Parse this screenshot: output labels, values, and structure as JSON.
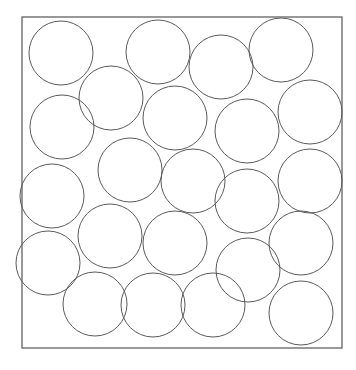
{
  "diagram": {
    "type": "circle-packing-in-square",
    "container": {
      "shape": "square",
      "x": 22,
      "y": 17,
      "width": 320,
      "height": 331,
      "stroke": "#555555"
    },
    "circle_count": 23,
    "circle_radius": 32,
    "circle_stroke": "#5a5a5a",
    "circles": [
      {
        "cx": 61,
        "cy": 53
      },
      {
        "cx": 158,
        "cy": 52
      },
      {
        "cx": 221,
        "cy": 67
      },
      {
        "cx": 281,
        "cy": 50
      },
      {
        "cx": 111,
        "cy": 98
      },
      {
        "cx": 62,
        "cy": 127
      },
      {
        "cx": 175,
        "cy": 118
      },
      {
        "cx": 247,
        "cy": 131
      },
      {
        "cx": 310,
        "cy": 112
      },
      {
        "cx": 130,
        "cy": 170
      },
      {
        "cx": 193,
        "cy": 181
      },
      {
        "cx": 52,
        "cy": 196
      },
      {
        "cx": 247,
        "cy": 201
      },
      {
        "cx": 310,
        "cy": 181
      },
      {
        "cx": 110,
        "cy": 236
      },
      {
        "cx": 175,
        "cy": 243
      },
      {
        "cx": 48,
        "cy": 263
      },
      {
        "cx": 301,
        "cy": 243
      },
      {
        "cx": 248,
        "cy": 270
      },
      {
        "cx": 95,
        "cy": 304
      },
      {
        "cx": 153,
        "cy": 305
      },
      {
        "cx": 213,
        "cy": 305
      },
      {
        "cx": 301,
        "cy": 313
      }
    ]
  }
}
